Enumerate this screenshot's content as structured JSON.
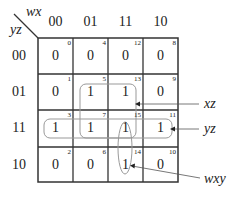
{
  "kmap": {
    "col_var": "wx",
    "row_var": "yz",
    "col_headers": [
      "00",
      "01",
      "11",
      "10"
    ],
    "row_headers": [
      "00",
      "01",
      "11",
      "10"
    ],
    "cells": [
      [
        {
          "v": "0",
          "i": "0"
        },
        {
          "v": "0",
          "i": "4"
        },
        {
          "v": "0",
          "i": "12"
        },
        {
          "v": "0",
          "i": "8"
        }
      ],
      [
        {
          "v": "0",
          "i": "1"
        },
        {
          "v": "1",
          "i": "5"
        },
        {
          "v": "1",
          "i": "13"
        },
        {
          "v": "0",
          "i": "9"
        }
      ],
      [
        {
          "v": "1",
          "i": "3"
        },
        {
          "v": "1",
          "i": "7"
        },
        {
          "v": "1",
          "i": "15"
        },
        {
          "v": "1",
          "i": "11"
        }
      ],
      [
        {
          "v": "0",
          "i": "2"
        },
        {
          "v": "0",
          "i": "6"
        },
        {
          "v": "1",
          "i": "14"
        },
        {
          "v": "0",
          "i": "10"
        }
      ]
    ],
    "groups": [
      {
        "label": "xz"
      },
      {
        "label": "yz"
      },
      {
        "label": "wxy"
      }
    ]
  }
}
